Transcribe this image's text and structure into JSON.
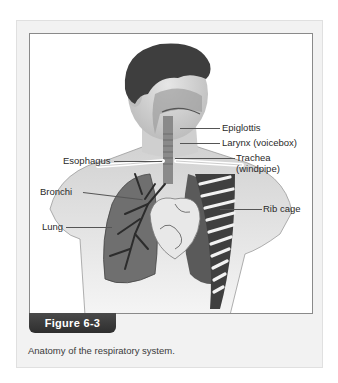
{
  "figure": {
    "number_label": "Figure 6-3",
    "caption": "Anatomy of the respiratory system.",
    "illustration": "respiratory-system-illustration",
    "labels": {
      "epiglottis": "Epiglottis",
      "larynx": "Larynx (voicebox)",
      "esophagus": "Esophagus",
      "trachea_line1": "Trachea",
      "trachea_line2": "(windpipe)",
      "bronchi": "Bronchi",
      "rib_cage": "Rib cage",
      "lung": "Lung"
    },
    "colors": {
      "tab_background": "#333333",
      "card_background": "#f2f2f2",
      "frame_border": "#8a8a8a"
    }
  }
}
